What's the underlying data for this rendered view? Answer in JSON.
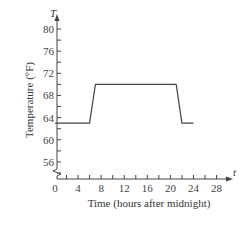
{
  "chart_data": {
    "type": "line",
    "title": "",
    "xlabel": "Time (hours after midnight)",
    "ylabel": "Temperature (°F)",
    "x_var": "t",
    "y_var": "T",
    "xlim": [
      0,
      30
    ],
    "ylim": [
      54,
      82
    ],
    "x_ticks": [
      0,
      4,
      8,
      12,
      16,
      20,
      24,
      28
    ],
    "x_minor_step": 2,
    "y_ticks": [
      56,
      60,
      64,
      68,
      72,
      76,
      80
    ],
    "y_minor_step": 2,
    "y_axis_break": true,
    "grid": false,
    "legend": null,
    "series": [
      {
        "name": "Temperature",
        "x": [
          0,
          6,
          7,
          21,
          22,
          24
        ],
        "y": [
          63,
          63,
          70,
          70,
          63,
          63
        ]
      }
    ]
  },
  "labels": {
    "xlabel": "Time (hours after midnight)",
    "ylabel": "Temperature (°F)",
    "x_var": "t",
    "y_var": "T",
    "x_ticks": [
      "0",
      "4",
      "8",
      "12",
      "16",
      "20",
      "24",
      "28"
    ],
    "y_ticks": [
      "56",
      "60",
      "64",
      "68",
      "72",
      "76",
      "80"
    ]
  }
}
